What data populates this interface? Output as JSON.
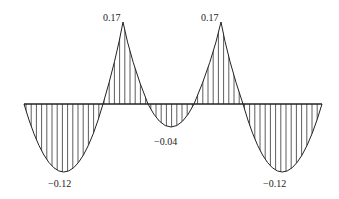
{
  "diagram": {
    "type": "bending-moment-diagram",
    "baseline": {
      "x_start": 24,
      "x_end": 322,
      "y": 104
    },
    "labels": [
      {
        "id": "peak-left",
        "text": "0.17",
        "x": 103,
        "y": 21
      },
      {
        "id": "peak-right",
        "text": "0.17",
        "x": 201,
        "y": 21
      },
      {
        "id": "valley-left",
        "text": "−0.12",
        "x": 48,
        "y": 187
      },
      {
        "id": "valley-middle",
        "text": "−0.04",
        "x": 154,
        "y": 145
      },
      {
        "id": "valley-right",
        "text": "−0.12",
        "x": 263,
        "y": 187
      }
    ],
    "values": [
      {
        "location": "left span",
        "value": -0.12
      },
      {
        "location": "left support",
        "value": 0.17
      },
      {
        "location": "middle span",
        "value": -0.04
      },
      {
        "location": "right support",
        "value": 0.17
      },
      {
        "location": "right span",
        "value": -0.12
      }
    ],
    "colors": {
      "line": "#222222",
      "hatch": "#333333",
      "background": "#ffffff"
    }
  }
}
